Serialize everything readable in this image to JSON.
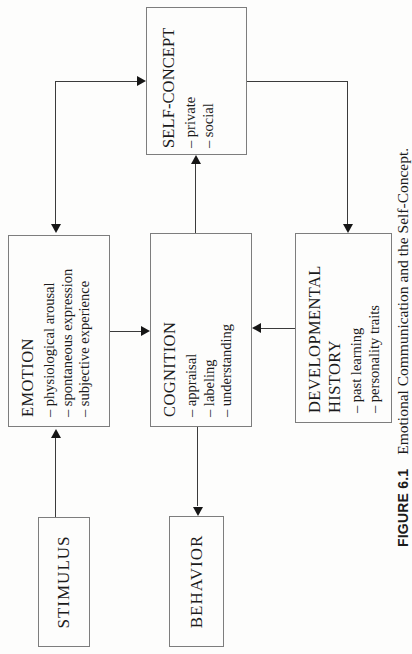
{
  "figure": {
    "caption_label": "FIGURE 6.1",
    "caption_text": "Emotional Communication and the Self-Concept."
  },
  "colors": {
    "background": "#fdfdfc",
    "box_border": "#7d7d7d",
    "arrow_line": "#3b3b3b",
    "arrow_head": "#161616",
    "text": "#1b1b1b"
  },
  "orientation_note": "diagram printed rotated 90 degrees counterclockwise on portrait page",
  "boxes": {
    "stimulus": {
      "title": "STIMULUS",
      "items": []
    },
    "emotion": {
      "title": "EMOTION",
      "items": [
        "– physiological arousal",
        "– spontaneous expression",
        "– subjective experience"
      ]
    },
    "self_concept": {
      "title": "SELF-CONCEPT",
      "items": [
        "– private",
        "– social"
      ]
    },
    "cognition": {
      "title": "COGNITION",
      "items": [
        "– appraisal",
        "– labeling",
        "– understanding"
      ]
    },
    "behavior": {
      "title": "BEHAVIOR",
      "items": []
    },
    "developmental_history": {
      "title": "DEVELOPMENTAL HISTORY",
      "items": [
        "– past learning",
        "– personality traits"
      ]
    }
  },
  "arrows": [
    {
      "from": "stimulus",
      "to": "emotion",
      "bidirectional": false
    },
    {
      "from": "emotion",
      "to": "self_concept",
      "bidirectional": true
    },
    {
      "from": "emotion",
      "to": "cognition",
      "bidirectional": false
    },
    {
      "from": "cognition",
      "to": "self_concept",
      "bidirectional": false
    },
    {
      "from": "developmental_history",
      "to": "cognition",
      "bidirectional": false
    },
    {
      "from": "self_concept",
      "to": "developmental_history",
      "bidirectional": false
    },
    {
      "from": "cognition",
      "to": "behavior",
      "bidirectional": false
    }
  ]
}
